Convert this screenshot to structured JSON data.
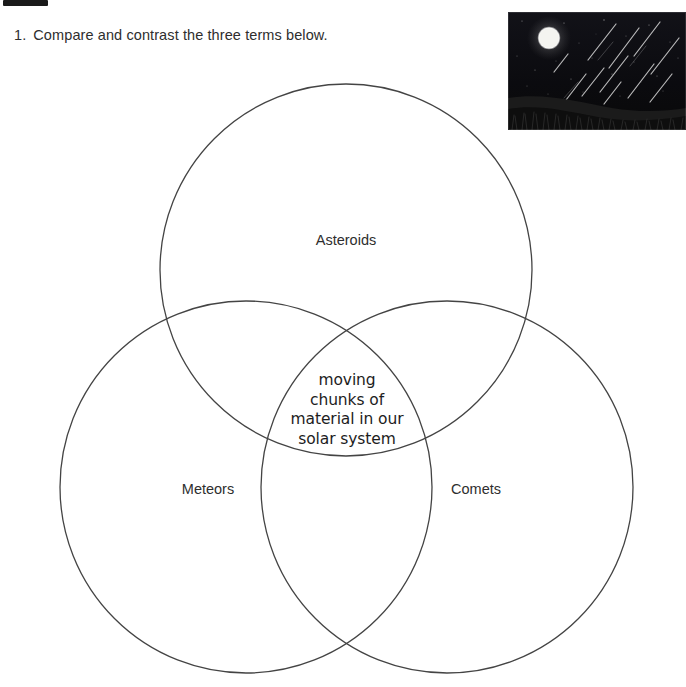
{
  "page": {
    "background_color": "#ffffff",
    "stroke_color": "#444444"
  },
  "question": {
    "number": "1.",
    "text": "Compare and contrast the three terms below."
  },
  "photo": {
    "name": "meteor-shower-night-sky-photo",
    "description": "Night sky with full moon, meteor streaks, stars and dark grassy hillside",
    "sky_color": "#0c0c10",
    "moon_color": "#f2f2ee",
    "ground_color": "#141414"
  },
  "venn": {
    "circles": [
      {
        "id": "asteroids",
        "label": "Asteroids",
        "cx": 346,
        "cy": 270,
        "r": 186
      },
      {
        "id": "meteors",
        "label": "Meteors",
        "cx": 246,
        "cy": 487,
        "r": 186
      },
      {
        "id": "comets",
        "label": "Comets",
        "cx": 447,
        "cy": 487,
        "r": 186
      }
    ],
    "center_answer": [
      "moving",
      "chunks of",
      "material in our",
      "solar system"
    ]
  }
}
